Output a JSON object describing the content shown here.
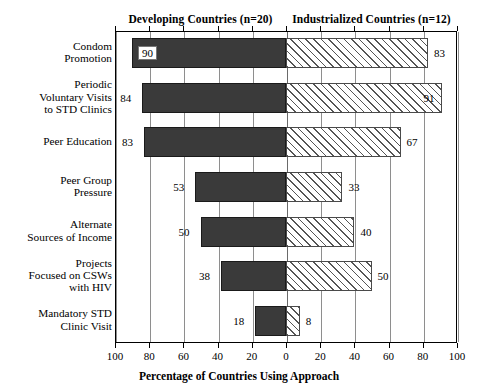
{
  "chart_data": {
    "type": "bar",
    "subtype": "diverging-horizontal-bar",
    "title": "",
    "xlabel": "Percentage of Countries Using Approach",
    "ylabel": "",
    "categories": [
      "Condom Promotion",
      "Periodic Voluntary Visits to STD Clinics",
      "Peer Education",
      "Peer Group Pressure",
      "Alternate Sources of Income",
      "Projects Focused on CSWs with HIV",
      "Mandatory STD Clinic Visit"
    ],
    "series": [
      {
        "name": "Developing Countries (n=20)",
        "side": "left",
        "style": "solid-dark",
        "values": [
          90,
          84,
          83,
          53,
          50,
          38,
          18
        ]
      },
      {
        "name": "Industrialized Countries (n=12)",
        "side": "right",
        "style": "diagonal-hatch",
        "values": [
          83,
          91,
          67,
          33,
          40,
          50,
          8
        ]
      }
    ],
    "xlim_left": [
      100,
      0
    ],
    "xlim_right": [
      0,
      100
    ],
    "tick_values": [
      100,
      80,
      60,
      40,
      20,
      0,
      20,
      40,
      60,
      80,
      100
    ],
    "grid": true,
    "legend_position": "top-columns"
  },
  "headers": {
    "left": "Developing Countries (n=20)",
    "right": "Industrialized Countries (n=12)"
  },
  "row_labels": [
    [
      "Condom",
      "Promotion"
    ],
    [
      "Periodic",
      "Voluntary Visits",
      "to STD Clinics"
    ],
    [
      "Peer Education"
    ],
    [
      "Peer Group",
      "Pressure"
    ],
    [
      "Alternate",
      "Sources of Income"
    ],
    [
      "Projects",
      "Focused on CSWs",
      "with HIV"
    ],
    [
      "Mandatory STD",
      "Clinic Visit"
    ]
  ],
  "axis": {
    "title": "Percentage of Countries Using Approach",
    "ticks": [
      "100",
      "80",
      "60",
      "40",
      "20",
      "0",
      "20",
      "40",
      "60",
      "80",
      "100"
    ]
  },
  "values": {
    "left": [
      "90",
      "84",
      "83",
      "53",
      "50",
      "38",
      "18"
    ],
    "right": [
      "83",
      "91",
      "67",
      "33",
      "40",
      "50",
      "8"
    ]
  },
  "colors": {
    "bar_left_fill": "#3a3a3a",
    "bar_right_fill": "#ffffff",
    "hatch": "#555555",
    "frame": "#000000",
    "grid": "#8e8e8e"
  }
}
